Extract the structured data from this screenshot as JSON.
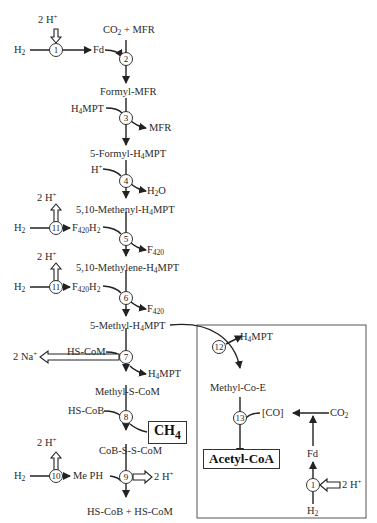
{
  "diagram": {
    "type": "methanogenesis-pathway",
    "main_pathway": [
      {
        "id": "co2_mfr",
        "label": "CO₂ + MFR"
      },
      {
        "id": "formyl_mfr",
        "label": "Formyl-MFR"
      },
      {
        "id": "formyl_h4mpt",
        "label": "5-Formyl-H₄MPT"
      },
      {
        "id": "methenyl_h4mpt",
        "label": "5,10-Methenyl-H₄MPT"
      },
      {
        "id": "methylene_h4mpt",
        "label": "5,10-Methylene-H₄MPT"
      },
      {
        "id": "methyl_h4mpt",
        "label": "5-Methyl-H₄MPT"
      },
      {
        "id": "methyl_s_com",
        "label": "Methyl-S-CoM"
      },
      {
        "id": "cob_s_s_com",
        "label": "CoB-S-S-CoM"
      },
      {
        "id": "hs_cob_hs_com",
        "label": "HS-CoB + HS-CoM"
      }
    ],
    "steps": [
      {
        "n": "1",
        "inputs": [
          "H₂"
        ],
        "outputs": [
          "Fd",
          "2 H⁺ (in)"
        ]
      },
      {
        "n": "2",
        "inputs": [
          "Fd"
        ],
        "outputs": []
      },
      {
        "n": "3",
        "inputs": [
          "H₄MPT"
        ],
        "outputs": [
          "MFR"
        ]
      },
      {
        "n": "4",
        "inputs": [
          "H⁺"
        ],
        "outputs": [
          "H₂O"
        ]
      },
      {
        "n": "5",
        "inputs": [
          "F₄₂₀H₂"
        ],
        "outputs": [
          "F₄₂₀"
        ]
      },
      {
        "n": "6",
        "inputs": [
          "F₄₂₀H₂"
        ],
        "outputs": [
          "F₄₂₀"
        ]
      },
      {
        "n": "7",
        "inputs": [
          "HS-CoM"
        ],
        "outputs": [
          "H₄MPT",
          "2 Na⁺"
        ]
      },
      {
        "n": "8",
        "inputs": [
          "HS-CoB"
        ],
        "outputs": [
          "CH₄"
        ]
      },
      {
        "n": "9",
        "inputs": [
          "Me PH"
        ],
        "outputs": [
          "2 H⁺"
        ]
      },
      {
        "n": "10",
        "inputs": [
          "H₂"
        ],
        "outputs": [
          "Me PH",
          "2 H⁺"
        ]
      },
      {
        "n": "11",
        "inputs": [
          "H₂"
        ],
        "outputs": [
          "F₄₂₀H₂",
          "2 H⁺"
        ]
      },
      {
        "n": "12",
        "inputs": [],
        "outputs": [
          "H₄MPT"
        ]
      },
      {
        "n": "13",
        "inputs": [
          "[CO]"
        ],
        "outputs": [
          "Acetyl-CoA"
        ]
      }
    ],
    "labels": {
      "h2": "H",
      "h2_sub": "2",
      "fd": "Fd",
      "two_h": "2 H",
      "plus": "+",
      "co2_mfr_a": "CO",
      "co2_mfr_sub": "2",
      "co2_mfr_b": " + MFR",
      "formyl_mfr": "Formyl-MFR",
      "h4mpt_a": "H",
      "h4mpt_sub": "4",
      "h4mpt_b": "MPT",
      "mfr": "MFR",
      "formyl_h4mpt_a": "5-Formyl-H",
      "formyl_h4mpt_b": "MPT",
      "h_plus": "H",
      "h2o_a": "H",
      "h2o_b": "O",
      "methenyl_a": "5,10-Methenyl-H",
      "methenyl_b": "MPT",
      "f420h2_a": "F",
      "f420_sub": "420",
      "f420h2_b": "H",
      "f420": "F",
      "methylene_a": "5,10-Methylene-H",
      "methylene_b": "MPT",
      "methyl_a": "5-Methyl-H",
      "methyl_b": "MPT",
      "hs_com": "HS-CoM",
      "two_na": "2 Na",
      "methyl_s_com": "Methyl-S-CoM",
      "hs_cob": "HS-CoB",
      "ch4_a": "CH",
      "ch4_sub": "4",
      "cob_s_s_com": "CoB-S-S-CoM",
      "me_ph": "Me PH",
      "hs_cob_hs_com": "HS-CoB + HS-CoM",
      "methyl_co_e": "Methyl-Co-E",
      "co_bracket": "[CO]",
      "co2": "CO",
      "acetyl_coa": "Acetyl-CoA"
    },
    "step_numbers": {
      "s1": "1",
      "s2": "2",
      "s3": "3",
      "s4": "4",
      "s5": "5",
      "s6": "6",
      "s7": "7",
      "s8": "8",
      "s9": "9",
      "s10": "10",
      "s11a": "11",
      "s11b": "11",
      "s12": "12",
      "s13": "13",
      "s1b": "1"
    },
    "colors": {
      "line": "#222222",
      "box_border": "#555555",
      "background": "#ffffff"
    }
  }
}
